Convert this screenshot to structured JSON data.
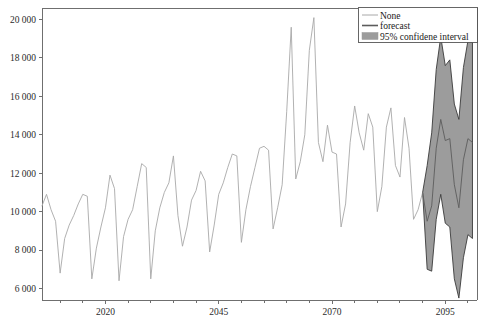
{
  "chart_data": {
    "type": "line",
    "title": "",
    "xlabel": "",
    "ylabel": "",
    "xlim": [
      2006,
      2102
    ],
    "ylim": [
      5400,
      20600
    ],
    "grid": false,
    "legend_position": "top-right",
    "y_ticks": [
      6000,
      8000,
      10000,
      12000,
      14000,
      16000,
      18000,
      20000
    ],
    "y_tick_labels": [
      "6 000",
      "8 000",
      "10 000",
      "12 000",
      "14 000",
      "16 000",
      "18 000",
      "20 000"
    ],
    "x_ticks": [
      2020,
      2045,
      2070,
      2095
    ],
    "x_tick_labels": [
      "2020",
      "2045",
      "2070",
      "2095"
    ],
    "x_minor_ticks": [
      2010,
      2015,
      2025,
      2030,
      2035,
      2040,
      2050,
      2055,
      2060,
      2065,
      2075,
      2080,
      2085,
      2090,
      2100
    ],
    "legend": [
      {
        "label": "None",
        "type": "line",
        "color": "#a8a8a8"
      },
      {
        "label": "forecast",
        "type": "line",
        "color": "#5c5c5c"
      },
      {
        "label": "95% confidene interval",
        "type": "patch",
        "color": "#9c9c9c"
      }
    ],
    "series": [
      {
        "name": "None",
        "color": "#a8a8a8",
        "x": [
          2006.0,
          2007.0,
          2008.0,
          2009.0,
          2010.0,
          2011.0,
          2012.0,
          2013.0,
          2014.0,
          2015.0,
          2016.0,
          2017.0,
          2018.0,
          2019.0,
          2020.0,
          2021.0,
          2022.0,
          2023.0,
          2024.0,
          2025.0,
          2026.0,
          2027.0,
          2028.0,
          2029.0,
          2030.0,
          2031.0,
          2032.0,
          2033.0,
          2034.0,
          2035.0,
          2036.0,
          2037.0,
          2038.0,
          2039.0,
          2040.0,
          2041.0,
          2042.0,
          2043.0,
          2044.0,
          2045.0,
          2046.0,
          2047.0,
          2048.0,
          2049.0,
          2050.0,
          2051.0,
          2052.0,
          2053.0,
          2054.0,
          2055.0,
          2056.0,
          2057.0,
          2058.0,
          2059.0,
          2060.0,
          2061.0,
          2062.0,
          2063.0,
          2064.0,
          2065.0,
          2066.0,
          2067.0,
          2068.0,
          2069.0,
          2070.0,
          2071.0,
          2072.0,
          2073.0,
          2074.0,
          2075.0,
          2076.0,
          2077.0,
          2078.0,
          2079.0,
          2080.0,
          2081.0,
          2082.0,
          2083.0,
          2084.0,
          2085.0,
          2086.0,
          2087.0,
          2088.0,
          2089.0,
          2090.0
        ],
        "y": [
          10300,
          10900,
          10100,
          9500,
          6800,
          8600,
          9300,
          9800,
          10400,
          10900,
          10800,
          6500,
          8100,
          9200,
          10200,
          11900,
          11200,
          6400,
          8700,
          9600,
          10100,
          11300,
          12500,
          12300,
          6500,
          9000,
          10200,
          11000,
          11500,
          12900,
          9800,
          8200,
          9200,
          10600,
          11100,
          12100,
          11600,
          7900,
          9300,
          10900,
          11500,
          12300,
          13000,
          12900,
          8400,
          10100,
          11300,
          12300,
          13300,
          13400,
          13200,
          9100,
          10200,
          11400,
          15200,
          19600,
          11700,
          12600,
          14000,
          18400,
          20100,
          13600,
          12600,
          14500,
          13100,
          13000,
          9200,
          10400,
          13600,
          15500,
          14100,
          13200,
          15100,
          14400,
          10000,
          11300,
          14400,
          15400,
          12400,
          11800,
          14900,
          13300,
          9600,
          10100,
          11000
        ]
      },
      {
        "name": "forecast",
        "color": "#5c5c5c",
        "x": [
          2090.0,
          2091.0,
          2092.0,
          2093.0,
          2094.0,
          2095.0,
          2096.0,
          2097.0,
          2098.0,
          2099.0,
          2100.0,
          2101.0
        ],
        "y": [
          11000,
          9500,
          10300,
          13300,
          14800,
          13700,
          13800,
          11400,
          10200,
          12700,
          13800,
          13600
        ]
      }
    ],
    "confidence_interval": {
      "level": 95,
      "x": [
        2090.0,
        2091.0,
        2092.0,
        2093.0,
        2094.0,
        2095.0,
        2096.0,
        2097.0,
        2098.0,
        2099.0,
        2100.0,
        2101.0
      ],
      "lower": [
        11000,
        7000,
        6900,
        9600,
        10900,
        9400,
        9200,
        6500,
        5500,
        7600,
        8800,
        8600
      ],
      "upper": [
        11000,
        12400,
        14100,
        17400,
        19100,
        17600,
        17900,
        15600,
        14800,
        17500,
        18900,
        18800
      ]
    }
  }
}
